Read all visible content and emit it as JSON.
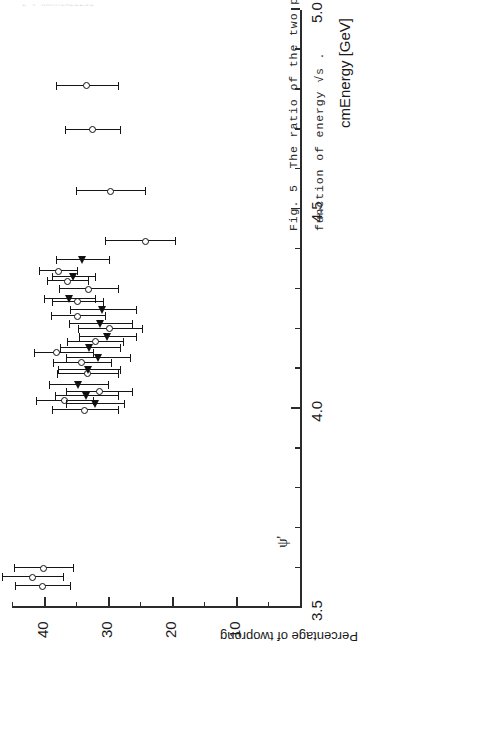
{
  "page": {
    "running_head": "2 4 RAMMLADZZNG"
  },
  "caption": {
    "line1": "Fig. 5  The ratio of the two prong cross section to the total cross section as",
    "line2": "function of energy √s ."
  },
  "chart_data": {
    "type": "scatter",
    "title": "",
    "xlabel": "cmEnergy [GeV]",
    "ylabel": "Percentage of twoprong",
    "xlim": [
      3.5,
      5.0
    ],
    "ylim": [
      0,
      45
    ],
    "xticks_major": [
      3.5,
      4.0,
      4.5,
      5.0
    ],
    "xtick_labels": [
      "3.5",
      "4.0",
      "4.5",
      "5.0"
    ],
    "xticks_minor": [
      3.6,
      3.7,
      3.8,
      3.9,
      4.1,
      4.2,
      4.3,
      4.4,
      4.6,
      4.7,
      4.8,
      4.9
    ],
    "yticks_major": [
      10,
      20,
      30,
      40
    ],
    "ytick_labels": [
      "10",
      "20",
      "30",
      "40"
    ],
    "yticks_minor": [
      5,
      15,
      25,
      35,
      45
    ],
    "grid": false,
    "legend": [
      {
        "marker": "open-circle",
        "name": "open circle series"
      },
      {
        "marker": "filled-triangle",
        "name": "filled triangle series"
      }
    ],
    "annotations": [
      {
        "text": "ψ'",
        "x": 3.686,
        "note": "psi-prime resonance marker with baseline rule"
      }
    ],
    "series": [
      {
        "name": "open circle series",
        "marker": "open-circle",
        "points": [
          {
            "x": 3.555,
            "y": 40.3,
            "yerr_low": 4.3,
            "yerr_high": 4.3
          },
          {
            "x": 3.577,
            "y": 41.8,
            "yerr_low": 4.7,
            "yerr_high": 4.7
          },
          {
            "x": 3.6,
            "y": 40.1,
            "yerr_low": 4.6,
            "yerr_high": 4.6
          },
          {
            "x": 3.996,
            "y": 33.6,
            "yerr_low": 5.1,
            "yerr_high": 5.1
          },
          {
            "x": 4.02,
            "y": 36.8,
            "yerr_low": 4.4,
            "yerr_high": 4.4
          },
          {
            "x": 4.043,
            "y": 31.4,
            "yerr_low": 5.2,
            "yerr_high": 5.2
          },
          {
            "x": 4.088,
            "y": 33.2,
            "yerr_low": 4.8,
            "yerr_high": 4.8
          },
          {
            "x": 4.115,
            "y": 34.1,
            "yerr_low": 4.5,
            "yerr_high": 4.5
          },
          {
            "x": 4.14,
            "y": 38.0,
            "yerr_low": 5.6,
            "yerr_high": 3.6
          },
          {
            "x": 4.168,
            "y": 32.0,
            "yerr_low": 4.4,
            "yerr_high": 4.4
          },
          {
            "x": 4.2,
            "y": 29.7,
            "yerr_low": 5.0,
            "yerr_high": 5.0
          },
          {
            "x": 4.232,
            "y": 34.7,
            "yerr_low": 4.2,
            "yerr_high": 4.2
          },
          {
            "x": 4.268,
            "y": 34.8,
            "yerr_low": 4.0,
            "yerr_high": 4.0
          },
          {
            "x": 4.3,
            "y": 33.1,
            "yerr_low": 4.6,
            "yerr_high": 4.6
          },
          {
            "x": 4.32,
            "y": 36.3,
            "yerr_low": 3.2,
            "yerr_high": 3.2
          },
          {
            "x": 4.345,
            "y": 37.8,
            "yerr_low": 3.0,
            "yerr_high": 3.0
          },
          {
            "x": 4.42,
            "y": 24.2,
            "yerr_low": 4.7,
            "yerr_high": 6.2
          },
          {
            "x": 4.545,
            "y": 29.6,
            "yerr_low": 5.4,
            "yerr_high": 5.4
          },
          {
            "x": 4.7,
            "y": 32.4,
            "yerr_low": 4.3,
            "yerr_high": 4.3
          },
          {
            "x": 4.81,
            "y": 33.3,
            "yerr_low": 4.9,
            "yerr_high": 4.9
          }
        ]
      },
      {
        "name": "filled triangle series",
        "marker": "filled-triangle",
        "points": [
          {
            "x": 4.012,
            "y": 32.0,
            "yerr_low": 4.5,
            "yerr_high": 4.5
          },
          {
            "x": 4.032,
            "y": 33.4,
            "yerr_low": 4.9,
            "yerr_high": 4.9
          },
          {
            "x": 4.06,
            "y": 34.6,
            "yerr_low": 4.6,
            "yerr_high": 4.6
          },
          {
            "x": 4.098,
            "y": 33.0,
            "yerr_low": 4.8,
            "yerr_high": 4.8
          },
          {
            "x": 4.128,
            "y": 31.5,
            "yerr_low": 5.0,
            "yerr_high": 5.0
          },
          {
            "x": 4.152,
            "y": 32.8,
            "yerr_low": 4.7,
            "yerr_high": 4.7
          },
          {
            "x": 4.18,
            "y": 30.1,
            "yerr_low": 4.4,
            "yerr_high": 4.4
          },
          {
            "x": 4.212,
            "y": 31.2,
            "yerr_low": 4.9,
            "yerr_high": 4.9
          },
          {
            "x": 4.248,
            "y": 30.8,
            "yerr_low": 5.1,
            "yerr_high": 5.1
          },
          {
            "x": 4.276,
            "y": 36.0,
            "yerr_low": 4.0,
            "yerr_high": 4.0
          },
          {
            "x": 4.33,
            "y": 35.4,
            "yerr_low": 3.4,
            "yerr_high": 3.4
          },
          {
            "x": 4.372,
            "y": 34.0,
            "yerr_low": 4.2,
            "yerr_high": 4.2
          }
        ]
      }
    ]
  }
}
